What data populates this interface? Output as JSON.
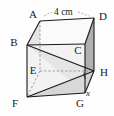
{
  "figure": {
    "shape": "cube",
    "projection": "oblique",
    "vertex_labels": {
      "A": "A",
      "B": "B",
      "C": "C",
      "D": "D",
      "E": "E",
      "F": "F",
      "G": "G",
      "H": "H"
    },
    "dimension_label": "4 cm",
    "angle_label": "x",
    "colors": {
      "outline": "#1a1a1a",
      "hidden_line": "#8a8a8a",
      "face_light": "#ebebeb",
      "face_mid": "#dcdcdc",
      "face_dark": "#b4b4b4",
      "background": "#fdfdfd",
      "text": "#1a1a1a"
    }
  }
}
